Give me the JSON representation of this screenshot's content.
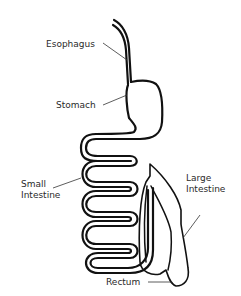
{
  "diagram": {
    "labels": {
      "esophagus": "Esophagus",
      "stomach": "Stomach",
      "small_intestine_1": "Small",
      "small_intestine_2": "Intestine",
      "large_intestine_1": "Large",
      "large_intestine_2": "Intestine",
      "rectum": "Rectum"
    },
    "colors": {
      "line": "#111111",
      "background": "#ffffff",
      "text": "#2a2a2a"
    }
  }
}
